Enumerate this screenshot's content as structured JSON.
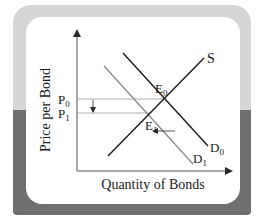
{
  "diagram": {
    "title": "",
    "y_axis_label": "Price per Bond",
    "x_axis_label": "Quantity of Bonds",
    "price_labels": {
      "p0": {
        "main": "P",
        "sub": "0"
      },
      "p1": {
        "main": "P",
        "sub": "1"
      }
    },
    "equilibrium_labels": {
      "e0": {
        "main": "E",
        "sub": "0"
      },
      "e1": {
        "main": "E",
        "sub": "1"
      }
    },
    "curve_labels": {
      "supply": "S",
      "demand0": {
        "main": "D",
        "sub": "0"
      },
      "demand1": {
        "main": "D",
        "sub": "1"
      }
    },
    "colors": {
      "frame_top": "#d6d6d6",
      "frame_bottom": "#6f6f6f",
      "panel": "#ffffff",
      "curve_dark": "#1a1a1a",
      "curve_light": "#8a8a8a",
      "guide_line": "#9a9a9a"
    },
    "annotations": [
      "Demand shifts left from D0 to D1",
      "Price falls from P0 to P1"
    ]
  }
}
